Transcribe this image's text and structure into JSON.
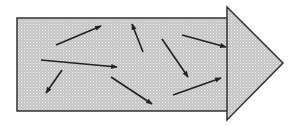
{
  "diagram": {
    "colors": {
      "fill": "#c8c8c8",
      "stipple": "#eeeeee",
      "stroke": "#333333",
      "arrow": "#222222"
    },
    "block_arrow": {
      "body": {
        "x": 17,
        "y": 18,
        "width": 211,
        "height": 93
      },
      "head": {
        "top": [
          227,
          7
        ],
        "tip": [
          283,
          63
        ],
        "bottom": [
          227,
          120
        ]
      }
    },
    "small_arrows": [
      {
        "from": [
          56,
          45
        ],
        "to": [
          101,
          26
        ]
      },
      {
        "from": [
          143,
          52
        ],
        "to": [
          132,
          24
        ]
      },
      {
        "from": [
          41,
          60
        ],
        "to": [
          117,
          67
        ]
      },
      {
        "from": [
          62,
          70
        ],
        "to": [
          46,
          93
        ]
      },
      {
        "from": [
          182,
          35
        ],
        "to": [
          226,
          47
        ]
      },
      {
        "from": [
          162,
          39
        ],
        "to": [
          188,
          77
        ]
      },
      {
        "from": [
          111,
          77
        ],
        "to": [
          152,
          104
        ]
      },
      {
        "from": [
          173,
          95
        ],
        "to": [
          221,
          78
        ]
      }
    ]
  }
}
